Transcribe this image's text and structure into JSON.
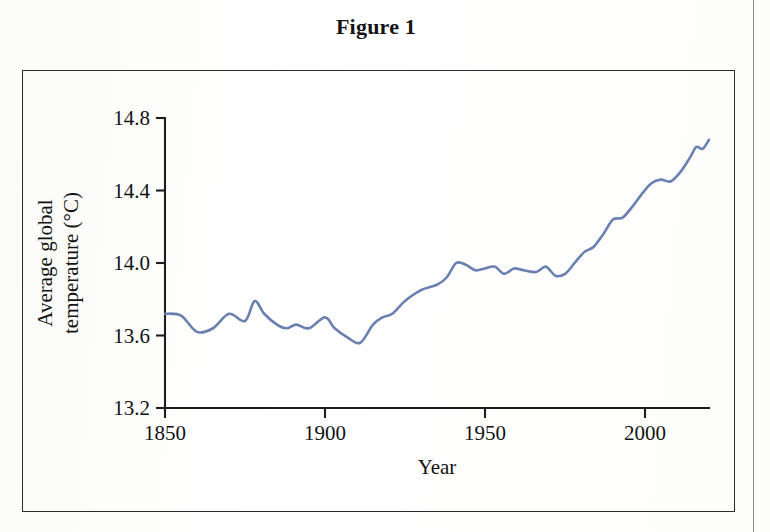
{
  "figure": {
    "title": "Figure 1"
  },
  "colors": {
    "line": "#6b7fb0",
    "axis": "#1d1d1d",
    "text": "#121212",
    "frame": "#2b2b2b",
    "page_background": "#fdfdfc"
  },
  "chart_data": {
    "type": "line",
    "title": "Figure 1",
    "xlabel": "Year",
    "ylabel": "Average global temperature (°C)",
    "ylabel_lines": [
      "Average global",
      "temperature (°C)"
    ],
    "xlim": [
      1850,
      2020
    ],
    "ylim": [
      13.2,
      14.8
    ],
    "xticks": [
      1850,
      1900,
      1950,
      2000
    ],
    "xtick_labels": [
      "1850",
      "1900",
      "1950",
      "2000"
    ],
    "yticks": [
      13.2,
      13.6,
      14.0,
      14.4,
      14.8
    ],
    "ytick_labels": [
      "13.2",
      "13.6",
      "14.0",
      "14.4",
      "14.8"
    ],
    "grid": false,
    "legend": null,
    "series": [
      {
        "name": "Average global temperature",
        "color": "#6b7fb0",
        "x": [
          1850,
          1855,
          1860,
          1865,
          1870,
          1875,
          1878,
          1881,
          1885,
          1888,
          1891,
          1895,
          1900,
          1903,
          1907,
          1911,
          1915,
          1918,
          1921,
          1925,
          1930,
          1935,
          1938,
          1941,
          1944,
          1947,
          1950,
          1953,
          1956,
          1959,
          1962,
          1966,
          1969,
          1972,
          1975,
          1978,
          1981,
          1984,
          1987,
          1990,
          1993,
          1996,
          1999,
          2002,
          2005,
          2008,
          2011,
          2014,
          2016,
          2018,
          2020
        ],
        "y": [
          13.72,
          13.71,
          13.62,
          13.64,
          13.72,
          13.68,
          13.79,
          13.72,
          13.66,
          13.64,
          13.66,
          13.64,
          13.7,
          13.64,
          13.59,
          13.56,
          13.66,
          13.7,
          13.72,
          13.79,
          13.85,
          13.88,
          13.92,
          14.0,
          13.99,
          13.96,
          13.97,
          13.98,
          13.94,
          13.97,
          13.96,
          13.95,
          13.98,
          13.93,
          13.94,
          14.0,
          14.06,
          14.09,
          14.16,
          14.24,
          14.25,
          14.31,
          14.38,
          14.44,
          14.46,
          14.45,
          14.5,
          14.58,
          14.64,
          14.63,
          14.68
        ]
      }
    ]
  },
  "plot_geometry": {
    "x_pixel_1850": 165,
    "x_pixel_2000": 645,
    "y_pixel_13_2": 408,
    "y_pixel_14_8": 118
  }
}
